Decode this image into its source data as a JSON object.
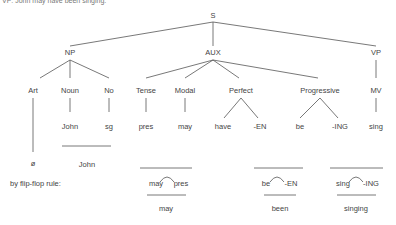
{
  "caption": "VP: John may have been singing.",
  "tree": {
    "root": "S",
    "level1": [
      "NP",
      "AUX",
      "VP"
    ],
    "np_children": [
      "Art",
      "Noun",
      "No"
    ],
    "aux_children": [
      "Tense",
      "Modal",
      "Perfect",
      "Progressive"
    ],
    "vp_children": [
      "MV"
    ],
    "leaves": {
      "art": "ø",
      "noun": "John",
      "no": "sg",
      "tense": "pres",
      "modal": "may",
      "perfect_1": "have",
      "perfect_2": "-EN",
      "progressive_1": "be",
      "progressive_2": "-ING",
      "mv": "sing"
    },
    "john_result": "John"
  },
  "flip_flop": {
    "label": "by flip-flop rule:",
    "groups": [
      {
        "left": "may",
        "right": "pres",
        "result": "may"
      },
      {
        "left": "be",
        "right": "-EN",
        "result": "been"
      },
      {
        "left": "sing",
        "right": "-ING",
        "result": "singing"
      }
    ]
  }
}
